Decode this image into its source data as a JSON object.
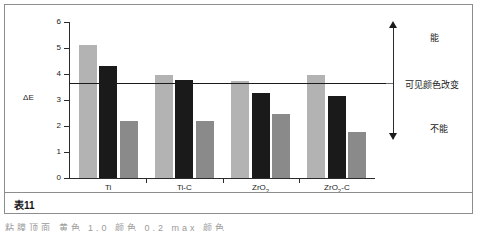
{
  "figure": {
    "caption": "表11",
    "cut_off_text": "粘膜顶面 黄色 1.0 颜色 0.2 max 颜色"
  },
  "annotations": {
    "above_label": "能",
    "threshold_label": "可见颜色改变",
    "below_label": "不能"
  },
  "colors": {
    "series_light_gray": "#b3b3b3",
    "series_black": "#1a1a1a",
    "series_medium_gray": "#8a8a8a",
    "axis": "#2b2b2b",
    "frame": "#8d8d8d"
  },
  "chart_data": {
    "type": "bar",
    "title": "",
    "xlabel": "",
    "ylabel": "ΔE",
    "ylim": [
      0,
      6
    ],
    "yticks": [
      0,
      1,
      2,
      3,
      4,
      5,
      6
    ],
    "grid": false,
    "legend_position": "none",
    "categories": [
      "Ti",
      "Ti-C",
      "ZrO2",
      "ZrO2-C"
    ],
    "category_labels_html": [
      "Ti",
      "Ti-C",
      "ZrO<sub>2</sub>",
      "ZrO<sub>2</sub>-C"
    ],
    "series": [
      {
        "name": "series-1",
        "color": "#b3b3b3",
        "values": [
          5.1,
          3.98,
          3.75,
          3.95
        ]
      },
      {
        "name": "series-2",
        "color": "#1a1a1a",
        "values": [
          4.3,
          3.78,
          3.27,
          3.16
        ]
      },
      {
        "name": "series-3",
        "color": "#8a8a8a",
        "values": [
          2.2,
          2.18,
          2.46,
          1.78
        ]
      }
    ],
    "threshold": {
      "value": 3.65,
      "label": "可见颜色改变"
    }
  }
}
